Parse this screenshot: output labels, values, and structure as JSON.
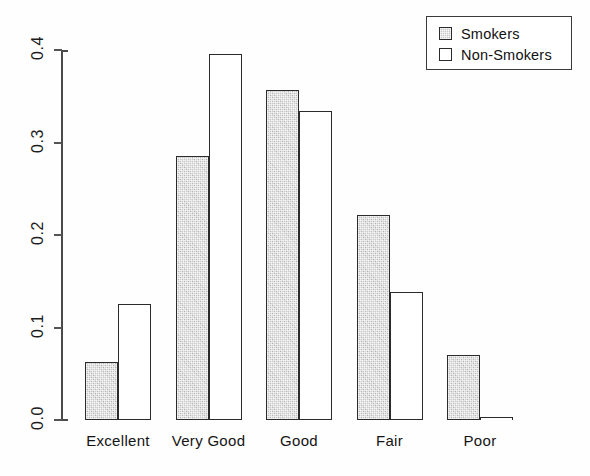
{
  "chart_data": {
    "type": "bar",
    "title": "",
    "subtitle": "",
    "xlabel": "",
    "ylabel": "",
    "categories": [
      "Excellent",
      "Very Good",
      "Good",
      "Fair",
      "Poor"
    ],
    "series": [
      {
        "name": "Smokers",
        "values": [
          0.063,
          0.285,
          0.357,
          0.222,
          0.07
        ]
      },
      {
        "name": "Non-Smokers",
        "values": [
          0.125,
          0.396,
          0.334,
          0.138,
          0.003
        ]
      }
    ],
    "ylim": [
      0.0,
      0.4
    ],
    "yticks": [
      0.0,
      0.1,
      0.2,
      0.3,
      0.4
    ],
    "ytick_labels": [
      "0.0",
      "0.1",
      "0.2",
      "0.3",
      "0.4"
    ],
    "ytick_label_rotation": 90,
    "xtick_labels": [
      "Excellent",
      "Very Good",
      "Good",
      "Fair",
      "Poor"
    ],
    "grid": false,
    "grouped": true,
    "legend": {
      "position": "top-right",
      "entries": [
        {
          "label": "Smokers",
          "swatch": "shaded-gray",
          "color": "#cccccc"
        },
        {
          "label": "Non-Smokers",
          "swatch": "white",
          "color": "#ffffff"
        }
      ]
    },
    "colors": {
      "smokers_fill": "#cccccc",
      "nonsmokers_fill": "#ffffff",
      "bar_outline": "#2b2b2b",
      "axis": "#4a4a4a",
      "text": "#141414",
      "background": "#fefefe"
    }
  }
}
